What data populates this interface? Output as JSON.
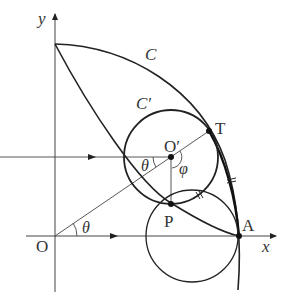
{
  "diagram": {
    "type": "geometry",
    "labels": {
      "y_axis": "y",
      "x_axis": "x",
      "origin": "O",
      "curve_C": "C",
      "curve_C_prime": "C′",
      "center_O_prime": "O′",
      "point_T": "T",
      "point_P": "P",
      "point_A": "A",
      "angle_theta_origin": "θ",
      "angle_theta_center": "θ",
      "angle_phi": "φ"
    },
    "colors": {
      "stroke": "#222222",
      "thin": "#444444",
      "background": "#ffffff"
    }
  }
}
